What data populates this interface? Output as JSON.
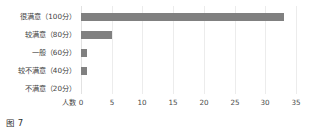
{
  "caption": "图 7",
  "chart_data": {
    "type": "bar",
    "orientation": "horizontal",
    "title": "",
    "xlabel": "人数",
    "ylabel": "",
    "categories": [
      "很满意（100分）",
      "较满意（80分）",
      "一般（60分）",
      "较不满意（40分）",
      "不满意（20分）"
    ],
    "values": [
      33,
      5,
      1,
      1,
      0
    ],
    "xticks": [
      "0",
      "5",
      "10",
      "15",
      "20",
      "25",
      "30",
      "35"
    ],
    "xtick_values": [
      0,
      5,
      10,
      15,
      20,
      25,
      30,
      35
    ],
    "xlim": [
      0,
      35
    ],
    "grid": "vertical-only",
    "legend": "none",
    "bar_color": "#808080",
    "gridline_color": "#ececec",
    "background": "#ffffff"
  }
}
